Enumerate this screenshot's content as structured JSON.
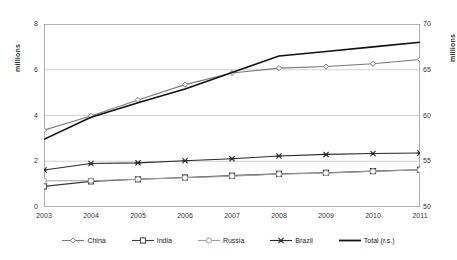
{
  "chart_data": {
    "type": "line",
    "title": "",
    "xlabel": "",
    "ylabel": "millions",
    "ylabel_right": "millions",
    "categories": [
      "2003",
      "2004",
      "2005",
      "2006",
      "2007",
      "2008",
      "2009",
      "2010",
      "2011"
    ],
    "ylim": [
      0,
      8
    ],
    "yticks": [
      "0",
      "2",
      "4",
      "6",
      "8"
    ],
    "ylim_right": [
      50,
      70
    ],
    "yticks_right": [
      "50",
      "55",
      "60",
      "65",
      "70"
    ],
    "grid": true,
    "legend_position": "bottom",
    "series": [
      {
        "name": "China",
        "marker": "diamond",
        "axis": "left",
        "values": [
          3.36,
          3.98,
          4.68,
          5.35,
          5.86,
          6.07,
          6.14,
          6.26,
          6.45
        ]
      },
      {
        "name": "India",
        "marker": "square",
        "axis": "left",
        "values": [
          0.9,
          1.12,
          1.21,
          1.29,
          1.37,
          1.45,
          1.5,
          1.57,
          1.63
        ]
      },
      {
        "name": "Russia",
        "marker": "circle",
        "axis": "left",
        "values": [
          1.15,
          1.15,
          1.21,
          1.28,
          1.35,
          1.44,
          1.48,
          1.56,
          1.62
        ]
      },
      {
        "name": "Brazil",
        "marker": "cross",
        "axis": "left",
        "values": [
          1.62,
          1.9,
          1.93,
          2.02,
          2.11,
          2.23,
          2.3,
          2.34,
          2.36
        ]
      },
      {
        "name": "Total (r.s.)",
        "marker": "none",
        "axis": "right",
        "values": [
          57.4,
          59.8,
          61.4,
          62.9,
          64.7,
          66.5,
          67.0,
          67.5,
          68.0
        ]
      }
    ]
  },
  "legend": {
    "items": [
      {
        "label": "China"
      },
      {
        "label": "India"
      },
      {
        "label": "Russia"
      },
      {
        "label": "Brazil"
      },
      {
        "label": "Total (r.s.)"
      }
    ]
  },
  "colors": {
    "axis": "#808080",
    "grid": "#c8c8c8",
    "china": "#7a7a7a",
    "india": "#3a3a3a",
    "russia": "#9e9e9e",
    "brazil": "#2b2b2b",
    "total": "#111111"
  }
}
